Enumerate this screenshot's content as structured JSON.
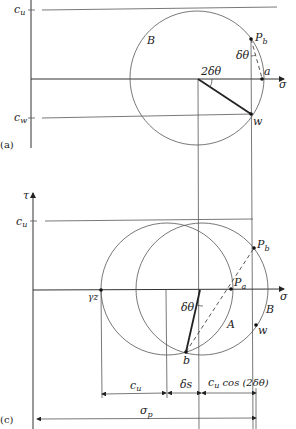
{
  "figure": {
    "panel_a": {
      "panel_label": "(a)",
      "axis_x_label": "σ",
      "cu_label": "c",
      "cu_sub": "u",
      "cw_label": "c",
      "cw_sub": "w",
      "circle_label": "B",
      "angle_center_label": "2δθ",
      "angle_pole_label": "δθ",
      "pole_label": "P",
      "pole_sub": "b",
      "point_a_label": "a",
      "point_w_label": "w"
    },
    "panel_c": {
      "panel_label": "(c)",
      "axis_y_label": "τ",
      "axis_x_label": "σ",
      "cu_label": "c",
      "cu_sub": "u",
      "gamma_z_label": "γz",
      "pole_a_label": "P",
      "pole_a_sub": "a",
      "pole_b_label": "P",
      "pole_b_sub": "b",
      "circle_a_label": "A",
      "circle_b_label": "B",
      "point_w_label": "w",
      "point_b_label": "b",
      "angle_label": "δθ",
      "dim_cu_label": "c",
      "dim_cu_sub": "u",
      "dim_ds_label": "δs",
      "dim_cucos_label": "c",
      "dim_cucos_sub": "u",
      "dim_cucos_tail": " cos (2δθ)",
      "dim_sigma_p_label": "σ",
      "dim_sigma_p_sub": "p"
    }
  }
}
